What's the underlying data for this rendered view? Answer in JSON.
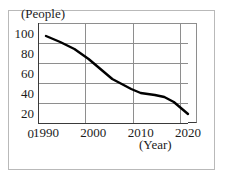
{
  "top_clipped_text": "",
  "axis_labels": {
    "y_unit": "(People)",
    "x_unit": "(Year)"
  },
  "colors": {
    "line": "#000000",
    "grid": "#8e8e8e",
    "axis": "#3a3a3a",
    "frame": "#b9b9b9",
    "text": "#1c1c1c"
  },
  "chart_data": {
    "type": "line",
    "title": "",
    "xlabel": "(Year)",
    "ylabel": "(People)",
    "xlim": [
      1990,
      2020
    ],
    "ylim": [
      0,
      100
    ],
    "grid": true,
    "legend": "none",
    "x_ticks": [
      "1990",
      "2000",
      "2010",
      "2020"
    ],
    "y_ticks": [
      "0",
      "20",
      "40",
      "60",
      "80",
      "100"
    ],
    "series": [
      {
        "name": "People",
        "x": [
          1990,
          1993,
          1996,
          1999,
          2002,
          2004,
          2006,
          2008,
          2010,
          2013,
          2015,
          2017,
          2020
        ],
        "values": [
          97,
          91,
          84,
          74,
          62,
          54,
          49,
          44,
          40,
          38,
          36,
          31,
          19
        ]
      }
    ]
  }
}
